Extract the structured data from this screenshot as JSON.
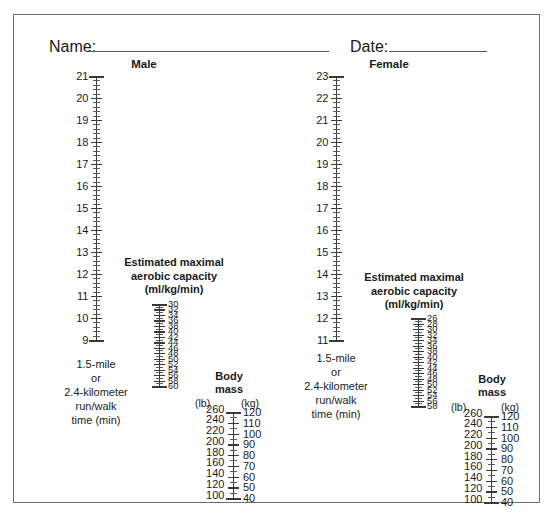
{
  "form": {
    "name_label": "Name:",
    "date_label": "Date:"
  },
  "panels": [
    {
      "id": "male",
      "title": "Male",
      "time_axis": {
        "name": "run-walk-time-axis-male",
        "caption_lines": [
          "1.5-mile",
          "or",
          "2.4-kilometer",
          "run/walk",
          "time (min)"
        ],
        "labels": [
          "21",
          "20",
          "19",
          "18",
          "17",
          "16",
          "15",
          "14",
          "13",
          "12",
          "11",
          "10",
          "9"
        ],
        "min": 9,
        "max": 21,
        "step": 1,
        "minor_per_step": 4
      },
      "vo2_axis": {
        "name": "vo2max-axis-male",
        "caption_lines": [
          "Estimated maximal",
          "aerobic capacity",
          "(ml/kg/min)"
        ],
        "labels": [
          "30",
          "32",
          "34",
          "36",
          "38",
          "40",
          "42",
          "44",
          "46",
          "48",
          "50",
          "52",
          "54",
          "56",
          "58",
          "60"
        ],
        "min": 30,
        "max": 60,
        "step": 2,
        "minor_per_step": 1,
        "units": "ml/kg/min"
      },
      "mass_axis": {
        "name": "body-mass-axis-male",
        "title_lines": [
          "Body",
          "mass"
        ],
        "left_unit": "(lb)",
        "right_unit": "(kg)",
        "lb_labels": [
          "260",
          "240",
          "220",
          "200",
          "180",
          "160",
          "140",
          "120",
          "100"
        ],
        "kg_labels": [
          "120",
          "110",
          "100",
          "90",
          "80",
          "70",
          "60",
          "50",
          "40"
        ],
        "kg_min": 40,
        "kg_max": 120,
        "kg_step": 10
      }
    },
    {
      "id": "female",
      "title": "Female",
      "time_axis": {
        "name": "run-walk-time-axis-female",
        "caption_lines": [
          "1.5-mile",
          "or",
          "2.4-kilometer",
          "run/walk",
          "time (min)"
        ],
        "labels": [
          "23",
          "22",
          "21",
          "20",
          "19",
          "18",
          "17",
          "16",
          "15",
          "14",
          "13",
          "12",
          "11"
        ],
        "min": 11,
        "max": 23,
        "step": 1,
        "minor_per_step": 4
      },
      "vo2_axis": {
        "name": "vo2max-axis-female",
        "caption_lines": [
          "Estimated maximal",
          "aerobic capacity",
          "(ml/kg/min)"
        ],
        "labels": [
          "26",
          "28",
          "30",
          "32",
          "34",
          "36",
          "38",
          "40",
          "42",
          "44",
          "46",
          "48",
          "50",
          "52",
          "54",
          "56",
          "58"
        ],
        "min": 26,
        "max": 58,
        "step": 2,
        "minor_per_step": 1,
        "units": "ml/kg/min"
      },
      "mass_axis": {
        "name": "body-mass-axis-female",
        "title_lines": [
          "Body",
          "mass"
        ],
        "left_unit": "(lb)",
        "right_unit": "(kg)",
        "lb_labels": [
          "260",
          "240",
          "220",
          "200",
          "180",
          "160",
          "140",
          "120",
          "100"
        ],
        "kg_labels": [
          "120",
          "110",
          "100",
          "90",
          "80",
          "70",
          "60",
          "50",
          "40"
        ],
        "kg_min": 40,
        "kg_max": 120,
        "kg_step": 10
      }
    }
  ],
  "colors": {
    "ink": "#1a1a1a",
    "axis": "#3a3a3a",
    "frame": "#6e6e6e"
  }
}
